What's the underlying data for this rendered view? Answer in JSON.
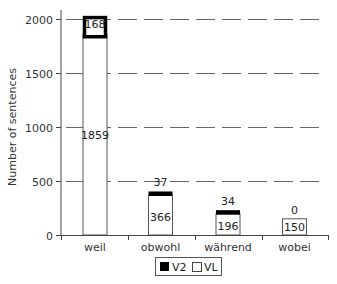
{
  "chart_data": {
    "type": "bar",
    "stacked": true,
    "title": "",
    "xlabel": "",
    "ylabel": "Number of sentences",
    "ylim": [
      0,
      2000
    ],
    "yticks": [
      0,
      500,
      1000,
      1500,
      2000
    ],
    "grid": "dashed horizontal",
    "legend_position": "bottom",
    "categories": [
      "weil",
      "obwohl",
      "während",
      "wobei"
    ],
    "series": [
      {
        "name": "VL",
        "color": "#ffffff",
        "values": [
          1859,
          366,
          196,
          150
        ]
      },
      {
        "name": "V2",
        "color": "#000000",
        "values": [
          168,
          37,
          34,
          0
        ]
      }
    ]
  },
  "axis": {
    "ylabel": "Number of sentences",
    "ticks": [
      "0",
      "500",
      "1000",
      "1500",
      "2000"
    ]
  },
  "legend": {
    "v2": "V2",
    "vl": "VL"
  }
}
